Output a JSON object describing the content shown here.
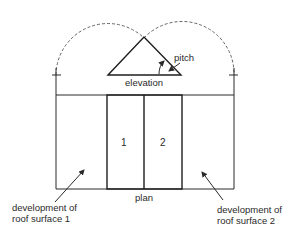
{
  "diagram": {
    "labels": {
      "pitch": "pitch",
      "elevation": "elevation",
      "plan": "plan",
      "surface_1_number": "1",
      "surface_2_number": "2",
      "development_1_line1": "development of",
      "development_1_line2": "roof surface 1",
      "development_2_line1": "development of",
      "development_2_line2": "roof surface 2"
    },
    "colors": {
      "line": "#2a2a2a",
      "dashed_arc": "#555555",
      "background": "#ffffff"
    }
  }
}
